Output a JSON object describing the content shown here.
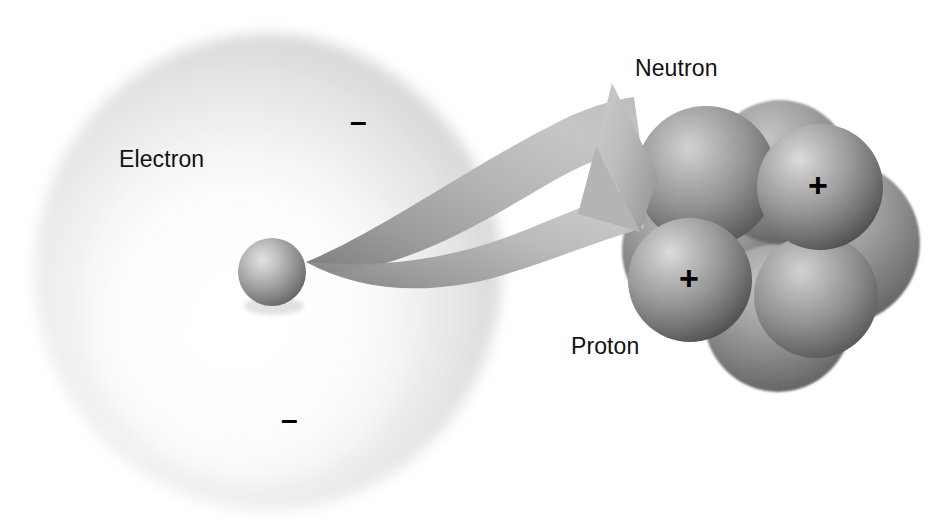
{
  "figure": {
    "background_color": "#ffffff"
  },
  "labels": {
    "electron": "Electron",
    "neutron": "Neutron",
    "proton": "Proton"
  },
  "charges": {
    "minus": "–",
    "plus": "+"
  },
  "electron_cloud": {
    "name": "electron-cloud",
    "cx": 268,
    "cy": 272,
    "rx": 234,
    "ry": 239,
    "fill_center": "#ffffff",
    "fill_edge": "#d8d8d8"
  },
  "electron_particle": {
    "name": "electron-particle",
    "cx": 272,
    "cy": 272,
    "r": 34,
    "highlight": "#d9d9d9",
    "shade": "#6f6f6f"
  },
  "arrow": {
    "name": "magnify-arrow",
    "start_x": 305,
    "start_y": 262,
    "tip_x": 658,
    "tip_y": 176,
    "fill_light": "#c9c9c9",
    "fill_dark": "#8a8a8a"
  },
  "nucleus": {
    "name": "nucleus-cluster",
    "cx": 772,
    "cy": 242,
    "r": 150,
    "backdrop_fill": "#9a9a9a",
    "nucleons": [
      {
        "id": "neutron-back-left",
        "type": "neutron",
        "cx": 706,
        "cy": 176,
        "r": 70,
        "charge": ""
      },
      {
        "id": "proton-upper-right",
        "type": "proton",
        "cx": 820,
        "cy": 187,
        "r": 63,
        "charge": "+"
      },
      {
        "id": "proton-lower-left",
        "type": "proton",
        "cx": 690,
        "cy": 280,
        "r": 62,
        "charge": "+"
      },
      {
        "id": "neutron-lower-right",
        "type": "neutron",
        "cx": 816,
        "cy": 296,
        "r": 62,
        "charge": ""
      }
    ]
  },
  "colors": {
    "ink": "#111111",
    "sphere_light": "#d5d5d5",
    "sphere_mid": "#9b9b9b",
    "sphere_dark": "#4f4f4f",
    "cloud_edge": "#d6d6d6"
  }
}
